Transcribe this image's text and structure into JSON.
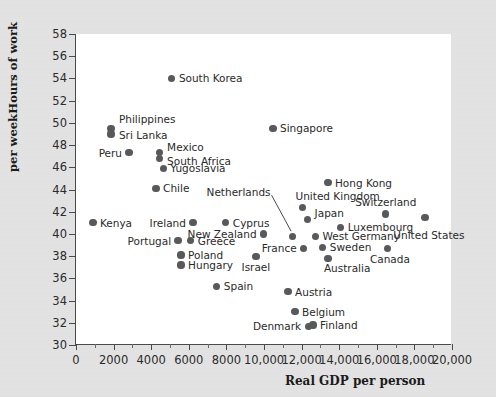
{
  "chart_data": {
    "type": "scatter",
    "title": "",
    "xlabel": "Real GDP per person",
    "ylabel_line1": "Hours of work",
    "ylabel_line2": "per week",
    "xlim": [
      0,
      20000
    ],
    "ylim": [
      30,
      58
    ],
    "xticks": [
      0,
      2000,
      4000,
      6000,
      8000,
      10000,
      12000,
      14000,
      16000,
      18000,
      20000
    ],
    "xticklabels": [
      "0",
      "2000",
      "4000",
      "6000",
      "8000",
      "10,000",
      "12,000",
      "14,000",
      "16,000",
      "18,000",
      "20,000"
    ],
    "yticks": [
      30,
      32,
      34,
      36,
      38,
      40,
      42,
      44,
      46,
      48,
      50,
      52,
      54,
      56,
      58
    ],
    "yticklabels": [
      "30",
      "32",
      "34",
      "36",
      "38",
      "40",
      "42",
      "44",
      "46",
      "48",
      "50",
      "52",
      "54",
      "56",
      "58"
    ],
    "grid": false,
    "legend": "none",
    "marker_color": "#58595b",
    "points": [
      {
        "label": "South Korea",
        "x": 5100,
        "y": 54.0,
        "lp": "r"
      },
      {
        "label": "Philippines",
        "x": 1860,
        "y": 49.5,
        "lp": "r",
        "ldx": 8,
        "ldy": -9
      },
      {
        "label": "Sri Lanka",
        "x": 1860,
        "y": 49.0,
        "lp": "r",
        "ldx": 8,
        "ldy": 1
      },
      {
        "label": "Peru",
        "x": 2820,
        "y": 47.3,
        "lp": "l"
      },
      {
        "label": "Mexico",
        "x": 4420,
        "y": 47.3,
        "lp": "r",
        "ldx": 8,
        "ldy": -6
      },
      {
        "label": "South Africa",
        "x": 4420,
        "y": 46.8,
        "lp": "r",
        "ldx": 8,
        "ldy": 3
      },
      {
        "label": "Yugoslavia",
        "x": 4640,
        "y": 45.9,
        "lp": "r"
      },
      {
        "label": "Chile",
        "x": 4260,
        "y": 44.1,
        "lp": "r"
      },
      {
        "label": "Singapore",
        "x": 10480,
        "y": 49.5,
        "lp": "r"
      },
      {
        "label": "Hong Kong",
        "x": 13400,
        "y": 44.6,
        "lp": "r"
      },
      {
        "label": "Kenya",
        "x": 900,
        "y": 41.0,
        "lp": "r"
      },
      {
        "label": "Ireland",
        "x": 6220,
        "y": 41.0,
        "lp": "l"
      },
      {
        "label": "Cyprus",
        "x": 7970,
        "y": 41.0,
        "lp": "r"
      },
      {
        "label": "New Zealand",
        "x": 9980,
        "y": 40.0,
        "lp": "l"
      },
      {
        "label": "Netherlands",
        "x": 11520,
        "y": 39.8,
        "lp": "leader"
      },
      {
        "label": "United Kingdom",
        "x": 12050,
        "y": 42.4,
        "lp": "r",
        "ldx": -7,
        "ldy": -11
      },
      {
        "label": "Japan",
        "x": 12320,
        "y": 41.3,
        "lp": "r",
        "ldx": 7,
        "ldy": -6
      },
      {
        "label": "Switzerland",
        "x": 16480,
        "y": 41.8,
        "lp": "c",
        "ldx": 0,
        "ldy": -12
      },
      {
        "label": "Luxembourg",
        "x": 14080,
        "y": 40.6,
        "lp": "r"
      },
      {
        "label": "West Germany",
        "x": 12740,
        "y": 39.8,
        "lp": "r"
      },
      {
        "label": "United States",
        "x": 18560,
        "y": 41.5,
        "lp": "c",
        "ldx": 4,
        "ldy": 18
      },
      {
        "label": "France",
        "x": 12110,
        "y": 38.7,
        "lp": "l"
      },
      {
        "label": "Sweden",
        "x": 13130,
        "y": 38.8,
        "lp": "r"
      },
      {
        "label": "Australia",
        "x": 13400,
        "y": 37.8,
        "lp": "r",
        "ldx": -4,
        "ldy": 10
      },
      {
        "label": "Canada",
        "x": 16590,
        "y": 38.7,
        "lp": "c",
        "ldx": 2,
        "ldy": 11
      },
      {
        "label": "Portugal",
        "x": 5430,
        "y": 39.4,
        "lp": "l"
      },
      {
        "label": "Greece",
        "x": 6110,
        "y": 39.4,
        "lp": "r"
      },
      {
        "label": "Poland",
        "x": 5590,
        "y": 38.1,
        "lp": "r"
      },
      {
        "label": "Hungary",
        "x": 5590,
        "y": 37.2,
        "lp": "r"
      },
      {
        "label": "Israel",
        "x": 9570,
        "y": 38.0,
        "lp": "c",
        "ldx": 0,
        "ldy": 11
      },
      {
        "label": "Spain",
        "x": 7490,
        "y": 35.3,
        "lp": "r"
      },
      {
        "label": "Austria",
        "x": 11280,
        "y": 34.8,
        "lp": "r"
      },
      {
        "label": "Belgium",
        "x": 11650,
        "y": 33.0,
        "lp": "r"
      },
      {
        "label": "Denmark",
        "x": 12350,
        "y": 31.7,
        "lp": "l"
      },
      {
        "label": "Finland",
        "x": 12610,
        "y": 31.8,
        "lp": "r"
      }
    ]
  }
}
